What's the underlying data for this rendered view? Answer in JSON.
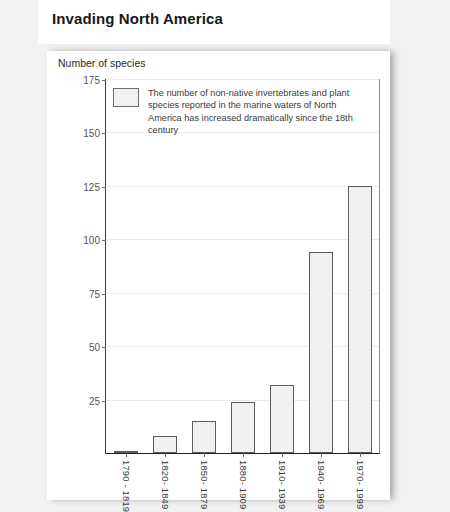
{
  "document": {
    "title": "Invading North America"
  },
  "figure": {
    "y_axis_title": "Number of species",
    "legend_text": "The number of non-native invertebrates and plant species reported in the marine waters of North America has increased dramatically since the 18th century",
    "legend_swatch_name": "series-swatch"
  },
  "chart_data": {
    "type": "bar",
    "title": "Invading North America",
    "xlabel": "",
    "ylabel": "Number of species",
    "ylim": [
      0,
      175
    ],
    "yticks": [
      25,
      50,
      75,
      100,
      125,
      150,
      175
    ],
    "grid": true,
    "legend_position": "top-left-inside",
    "categories": [
      "1790 - 1819",
      "1820- 1849",
      "1850- 1879",
      "1880- 1909",
      "1910- 1939",
      "1940- 1969",
      "1970- 1999"
    ],
    "values": [
      1,
      8,
      15,
      24,
      32,
      94,
      125
    ],
    "series": [
      {
        "name": "Non-native species reported",
        "values": [
          1,
          8,
          15,
          24,
          32,
          94,
          125
        ]
      }
    ],
    "colors": {
      "bar_fill": "#f0f0f0",
      "bar_border": "#5c5c5c",
      "axis": "#232323",
      "grid": "#ececec",
      "text": "#3a3a3a"
    }
  }
}
